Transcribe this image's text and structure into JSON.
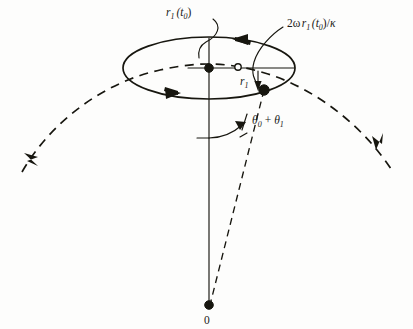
{
  "figure": {
    "background_color": "#fdfdfc",
    "ink_color": "#17160f",
    "width": 413,
    "height": 329
  },
  "labels": {
    "radius_t0": {
      "base": "r",
      "base_sub": "1",
      "arg_open": "(t",
      "arg_sub": "0",
      "arg_close": ")",
      "text": "r1(t0)",
      "x": 166,
      "y": 16
    },
    "velocity": {
      "prefix": "2ω",
      "base": "r",
      "base_sub": "1",
      "arg_open": "(t",
      "arg_sub": "0",
      "arg_close": ")/",
      "kappa": "κ",
      "text": "2ωr1(t0)/κ",
      "x": 284,
      "y": 28
    },
    "radius_small": {
      "base": "r",
      "base_sub": "1",
      "text": "r1",
      "x": 243,
      "y": 85
    },
    "angle": {
      "theta0": "θ",
      "theta0_sub": "0",
      "plus": "+",
      "theta1": "θ",
      "theta1_sub": "1",
      "text": "θ0 + θ1",
      "x": 252,
      "y": 125
    },
    "origin": {
      "text": "0",
      "x": 205,
      "y": 322
    }
  },
  "geometry": {
    "ellipse": {
      "cx": 209,
      "cy": 68,
      "rx": 86,
      "ry": 31
    },
    "center_dot": {
      "cx": 209,
      "cy": 68,
      "r": 4.3
    },
    "open_circle": {
      "cx": 238,
      "cy": 67,
      "r": 3.2
    },
    "particle_dot": {
      "cx": 264,
      "cy": 90,
      "r": 5.2
    },
    "origin_dot": {
      "cx": 209,
      "cy": 305,
      "r": 4.3
    },
    "vertical_axis": {
      "x": 209,
      "y_top": 38,
      "y_bottom": 305
    },
    "angle_arc_radius": 50,
    "trajectory_description": "dashed great-circle arc passing through the ellipse with arrowheads at both ends"
  },
  "elements": {
    "ellipse_name": "rotation-circle",
    "trajectory_name": "orbit-trajectory-dashed",
    "radial_line_name": "radial-line-to-origin",
    "vertical_axis_name": "vertical-axis-line"
  }
}
